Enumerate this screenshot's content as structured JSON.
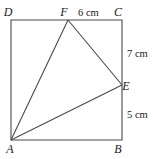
{
  "figure": {
    "type": "geometry-diagram",
    "background_color": "#ffffff",
    "stroke_color": "#4a4a4a",
    "text_color": "#1a1a1a",
    "vertices": {
      "A": {
        "label": "A",
        "x": 11,
        "y": 140
      },
      "B": {
        "label": "B",
        "x": 122,
        "y": 140
      },
      "C": {
        "label": "C",
        "x": 122,
        "y": 20
      },
      "D": {
        "label": "D",
        "x": 11,
        "y": 20
      },
      "E": {
        "label": "E",
        "x": 122,
        "y": 85
      },
      "F": {
        "label": "F",
        "x": 68,
        "y": 20
      }
    },
    "label_positions": {
      "A": {
        "x": 10,
        "y": 153
      },
      "B": {
        "x": 118,
        "y": 153
      },
      "C": {
        "x": 118,
        "y": 16
      },
      "D": {
        "x": 8,
        "y": 16
      },
      "E": {
        "x": 126,
        "y": 90
      },
      "F": {
        "x": 64,
        "y": 16
      }
    },
    "square": {
      "name": "ABCD",
      "path": "M 11 20 L 122 20 L 122 140 L 11 140 Z"
    },
    "triangle": {
      "name": "AFE",
      "segments": [
        {
          "name": "A-F",
          "x1": 11,
          "y1": 140,
          "x2": 68,
          "y2": 20
        },
        {
          "name": "F-E",
          "x1": 68,
          "y1": 20,
          "x2": 122,
          "y2": 85
        },
        {
          "name": "A-E",
          "x1": 11,
          "y1": 140,
          "x2": 122,
          "y2": 85
        }
      ]
    },
    "measurements": [
      {
        "name": "FC",
        "text": "6 cm",
        "x": 78,
        "y": 16,
        "anchor": "start"
      },
      {
        "name": "CE",
        "text": "7 cm",
        "x": 127,
        "y": 57,
        "anchor": "start"
      },
      {
        "name": "EB",
        "text": "5 cm",
        "x": 127,
        "y": 118,
        "anchor": "start"
      }
    ]
  }
}
